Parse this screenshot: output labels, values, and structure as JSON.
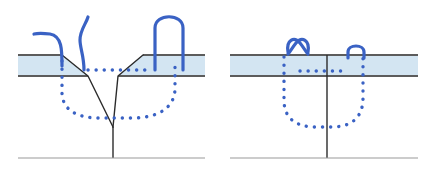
{
  "figure": {
    "title": "",
    "caption": "",
    "background_color": "#ffffff",
    "width": 435,
    "height": 179,
    "panel_count": 2
  },
  "colors": {
    "layer_fill": "#d3e5f2",
    "layer_border": "#5c5c5c",
    "baseline": "#9a9a9a",
    "notch_line": "#2b2b2b",
    "trace_blue": "#3a62c4",
    "dotted_blue": "#3a62c4"
  },
  "style": {
    "layer_border_width": 1.8,
    "baseline_width": 1.2,
    "notch_line_width": 1.4,
    "trace_width": 3.2,
    "dotted_width": 3.4,
    "dot_dasharray": "0.1 8"
  },
  "panels": [
    {
      "id": "panel-left",
      "label": "",
      "geometry": {
        "layer_band": {
          "left": 18,
          "right": 205,
          "top": 55,
          "bottom": 76,
          "fill": "#d3e5f2"
        },
        "baseline": {
          "left": 18,
          "right": 205,
          "y": 158
        },
        "notch": {
          "type": "v-notch",
          "top_left_x": 62,
          "top_right_x": 143,
          "mouth_left_x": 88,
          "mouth_right_x": 118,
          "apex_x": 113,
          "apex_y": 127,
          "stem_bottom_y": 158
        }
      },
      "dotted_path": {
        "name": "subsurface-damage-zone",
        "shape": "u-curve",
        "left_x": 62,
        "right_x": 175,
        "top_y": 66,
        "bottom_y": 112
      },
      "traces": [
        {
          "name": "hook-trace",
          "shape": "hook",
          "anchor_x": 62,
          "peak_y": 34,
          "reach_x": 36
        },
        {
          "name": "wavy-trace",
          "shape": "wave",
          "anchor_x": 84,
          "peak_y": 17
        },
        {
          "name": "arch-trace",
          "shape": "arch",
          "left_x": 155,
          "right_x": 183,
          "peak_y": 13
        }
      ]
    },
    {
      "id": "panel-right",
      "label": "",
      "geometry": {
        "layer_band": {
          "left": 230,
          "right": 418,
          "top": 55,
          "bottom": 76,
          "fill": "#d3e5f2"
        },
        "baseline": {
          "left": 230,
          "right": 418,
          "y": 158
        },
        "notch": {
          "type": "vertical-crack",
          "x": 327,
          "top_y": 55,
          "bottom_y": 158
        }
      },
      "dotted_path": {
        "name": "subsurface-damage-zone",
        "shape": "u-curve",
        "left_x": 284,
        "right_x": 363,
        "top_y": 58,
        "bottom_y": 121
      },
      "traces": [
        {
          "name": "crossed-loop-trace",
          "shape": "x-loop",
          "center_x": 296,
          "top_y": 40
        },
        {
          "name": "small-arch-trace",
          "shape": "small-arch",
          "center_x": 356,
          "top_y": 48
        }
      ]
    }
  ]
}
